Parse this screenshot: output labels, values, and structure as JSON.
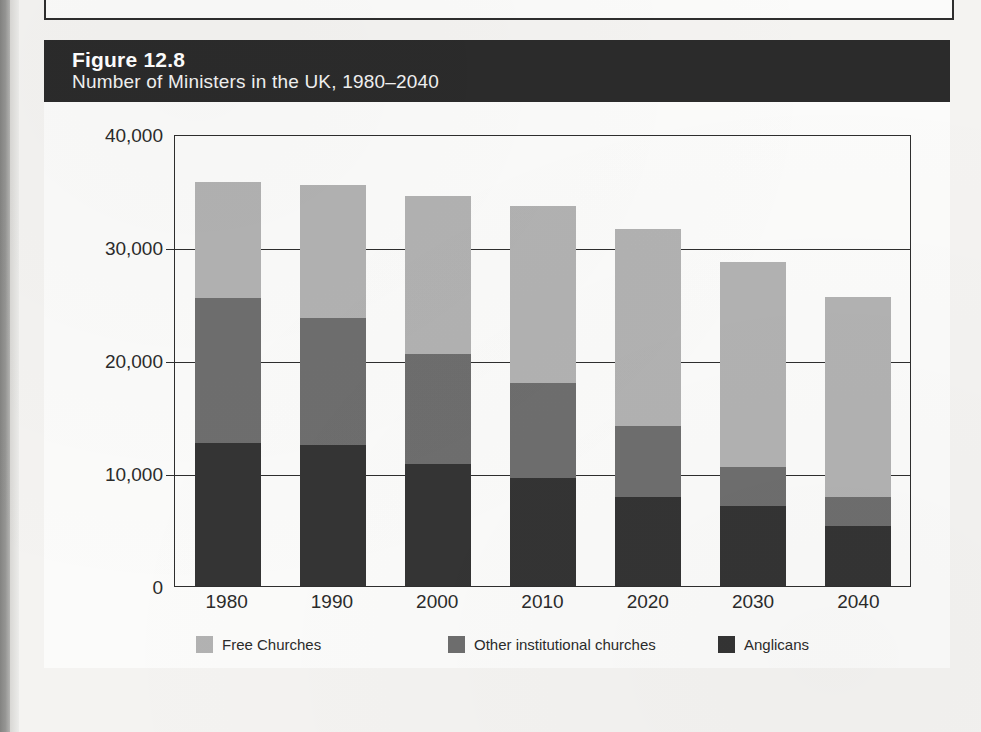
{
  "figure": {
    "number_label": "Figure 12.8",
    "title": "Number of Ministers in the UK, 1980–2040"
  },
  "colors": {
    "free_churches": "#b2b2b2",
    "other_institutional": "#6e6e6e",
    "anglicans": "#343434",
    "header_background": "#2b2b2b",
    "axis": "#2e2e2e"
  },
  "axis": {
    "y_ticks": [
      "40,000",
      "30,000",
      "20,000",
      "10,000",
      "0"
    ],
    "x_ticks": [
      "1980",
      "1990",
      "2000",
      "2010",
      "2020",
      "2030",
      "2040"
    ]
  },
  "legend": {
    "items": [
      {
        "label": "Free Churches",
        "swatch": "light"
      },
      {
        "label": "Other institutional churches",
        "swatch": "medium"
      },
      {
        "label": "Anglicans",
        "swatch": "dark"
      }
    ]
  },
  "chart_data": {
    "type": "bar",
    "stacked": true,
    "title": "Number of Ministers in the UK, 1980–2040",
    "subtitle": "Figure 12.8",
    "xlabel": "",
    "ylabel": "",
    "categories": [
      "1980",
      "1990",
      "2000",
      "2010",
      "2020",
      "2030",
      "2040"
    ],
    "ylim": [
      0,
      40000
    ],
    "yticks": [
      0,
      10000,
      20000,
      30000,
      40000
    ],
    "grid": true,
    "legend_position": "bottom",
    "series": [
      {
        "name": "Anglicans",
        "color": "#343434",
        "values": [
          12700,
          12500,
          10800,
          9600,
          7900,
          7100,
          5300
        ]
      },
      {
        "name": "Other institutional churches",
        "color": "#6e6e6e",
        "values": [
          12800,
          11200,
          9700,
          8400,
          6300,
          3400,
          2600
        ]
      },
      {
        "name": "Free Churches",
        "color": "#b2b2b2",
        "values": [
          10300,
          11800,
          14000,
          15600,
          17400,
          18200,
          17700
        ]
      }
    ],
    "totals": [
      35800,
      35500,
      34500,
      33600,
      31600,
      28700,
      25600
    ]
  }
}
